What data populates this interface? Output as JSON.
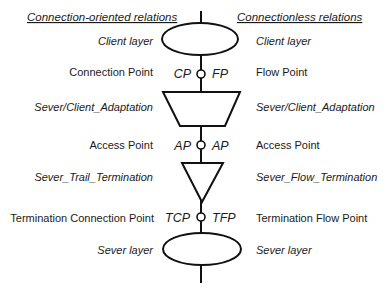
{
  "headers": {
    "left": "Connection-oriented relations",
    "right": "Connectionless relations"
  },
  "rows": [
    {
      "id": "client-layer",
      "left": "Client layer",
      "right": "Client layer",
      "left_italic": true,
      "right_italic": true,
      "shape": "ellipse"
    },
    {
      "id": "connection-point",
      "left": "Connection Point",
      "right": "Flow Point",
      "left_abbr": "CP",
      "right_abbr": "FP",
      "left_italic": false,
      "right_italic": false,
      "shape": "point"
    },
    {
      "id": "adaptation",
      "left": "Sever/Client_Adaptation",
      "right": "Sever/Client_Adaptation",
      "left_italic": true,
      "right_italic": true,
      "shape": "trapezoid"
    },
    {
      "id": "access-point",
      "left": "Access Point",
      "right": "Access Point",
      "left_abbr": "AP",
      "right_abbr": "AP",
      "left_italic": false,
      "right_italic": false,
      "shape": "point"
    },
    {
      "id": "termination",
      "left": "Sever_Trail_Termination",
      "right": "Sever_Flow_Termination",
      "left_italic": true,
      "right_italic": true,
      "shape": "triangle"
    },
    {
      "id": "termination-point",
      "left": "Termination Connection Point",
      "right": "Termination Flow Point",
      "left_abbr": "TCP",
      "right_abbr": "TFP",
      "left_italic": false,
      "right_italic": false,
      "shape": "point"
    },
    {
      "id": "server-layer",
      "left": "Sever layer",
      "right": "Sever layer",
      "left_italic": true,
      "right_italic": true,
      "shape": "ellipse"
    }
  ],
  "colors": {
    "stroke": "#111111",
    "text": "#1a1a1a",
    "background": "#ffffff"
  }
}
